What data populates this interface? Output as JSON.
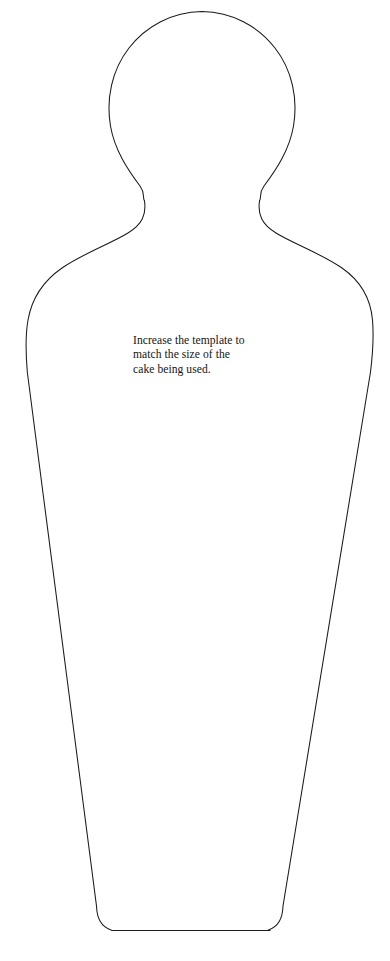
{
  "page": {
    "background_color": "#ffffff",
    "width": 390,
    "height": 961
  },
  "template": {
    "name": "body-silhouette-cake-template",
    "description": "Outline drawing of a head-and-torso body shape tapering to a flat rounded base",
    "stroke_color": "#1a1a1a",
    "fill_color": "#ffffff",
    "stroke_width": 1.1,
    "outline_path": "M 202 11 C 240 11 268 26 282 50 C 296 74 297 105 289 133 C 281 161 268 180 259 192 C 254 198 257.5 200 258 204 C 259 218 268 228 284 238 C 304 251 330 266 348 286 C 364 304 371 330 372 360 C 372.5 376 368 390 364 404 L 300 880 C 298 895 297 905 295 915 C 293 926 288 932 277 932.5 L 98 932.5 C 88 932 103 926 101 915 C 99 905 98 895 96 880 L 31 404 C 27 390 25 376 26 352 C 27 322 35 300 51 284 C 69 266 95 251 115 238 C 131 228 140 218 141.5 204 C 142 200 146 198 141 192 C 132 180 119 161 111 133 C 103 105 104 74 118 50 C 132 26 164 11 202 11 Z"
  },
  "instruction": {
    "text": "Increase the template to\nmatch the size of the\ncake being used.",
    "lines": [
      "Increase the template to",
      "match the size of the",
      "cake being used."
    ],
    "color": "#141414"
  }
}
